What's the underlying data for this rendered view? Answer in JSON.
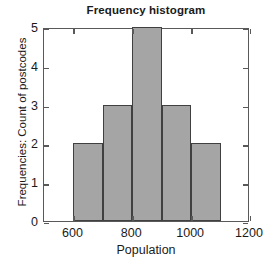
{
  "chart_data": {
    "type": "bar",
    "title": "Frequency histogram",
    "xlabel": "Population",
    "ylabel": "Frequencies: Count of postcodes",
    "xlim": [
      500,
      1200
    ],
    "ylim": [
      0,
      5
    ],
    "grid": false,
    "legend": null,
    "bin_width": 100,
    "categories": [
      "600-700",
      "700-800",
      "800-900",
      "900-1000",
      "1000-1100"
    ],
    "bin_edges": [
      600,
      700,
      800,
      900,
      1000,
      1100
    ],
    "values": [
      2,
      3,
      5,
      3,
      2
    ],
    "bar_fill_color": "#a5a5a5",
    "bar_edge_color": "#404040",
    "axis_color": "#595959",
    "background_color": "#ffffff",
    "xticks": [
      {
        "value": 600,
        "label": "600"
      },
      {
        "value": 800,
        "label": "800"
      },
      {
        "value": 1000,
        "label": "1000"
      },
      {
        "value": 1200,
        "label": "1200"
      }
    ],
    "yticks": [
      {
        "value": 0,
        "label": "0"
      },
      {
        "value": 1,
        "label": "1"
      },
      {
        "value": 2,
        "label": "2"
      },
      {
        "value": 3,
        "label": "3"
      },
      {
        "value": 4,
        "label": "4"
      },
      {
        "value": 5,
        "label": "5"
      }
    ]
  }
}
